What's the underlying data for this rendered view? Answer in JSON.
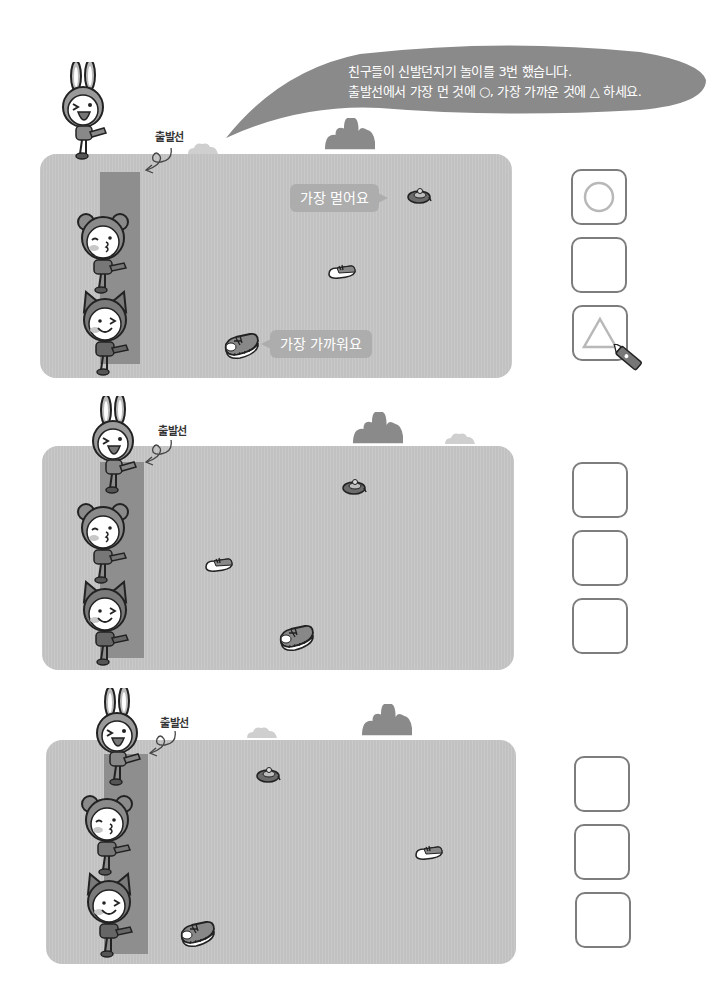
{
  "instructions": {
    "line1": "친구들이 신발던지기 놀이를 3번 했습니다.",
    "line2": "출발선에서 가장 먼 것에 ○, 가장 가까운 것에 △ 하세요."
  },
  "colors": {
    "field": "#c6c6c6",
    "start_line": "#8e8e8e",
    "bubble": "#8a8a8a",
    "callout": "#adadad",
    "box_border": "#7d7d7d",
    "example_mark": "#b8b8b8"
  },
  "rounds": [
    {
      "start_label": "출발선",
      "callouts": {
        "farthest": "가장 멀어요",
        "nearest": "가장 가까워요"
      },
      "shoes": [
        {
          "type": "slipper",
          "desc": "dark slipper, farthest"
        },
        {
          "type": "sneaker-small",
          "desc": "middle"
        },
        {
          "type": "sneaker-large",
          "desc": "nearest"
        }
      ],
      "answers": [
        {
          "mark": "circle-icon"
        },
        {
          "mark": ""
        },
        {
          "mark": "triangle-icon"
        }
      ]
    },
    {
      "start_label": "출발선",
      "shoes": [
        {
          "type": "slipper"
        },
        {
          "type": "sneaker-small"
        },
        {
          "type": "sneaker-large"
        }
      ],
      "answers": [
        {
          "mark": ""
        },
        {
          "mark": ""
        },
        {
          "mark": ""
        }
      ]
    },
    {
      "start_label": "출발선",
      "shoes": [
        {
          "type": "slipper"
        },
        {
          "type": "sneaker-small"
        },
        {
          "type": "sneaker-large"
        }
      ],
      "answers": [
        {
          "mark": ""
        },
        {
          "mark": ""
        },
        {
          "mark": ""
        }
      ]
    }
  ]
}
